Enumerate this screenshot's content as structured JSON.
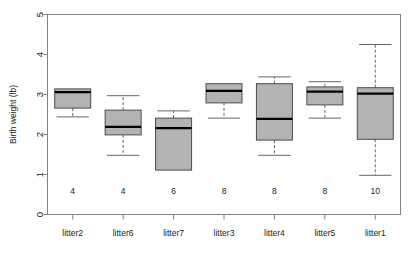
{
  "chart_data": {
    "type": "box",
    "title": "",
    "xlabel": "",
    "ylabel": "Birth weight (lb)",
    "ylim": [
      0,
      5
    ],
    "yticks": [
      0,
      1,
      2,
      3,
      4,
      5
    ],
    "ytick_labels": [
      "0",
      "1",
      "2",
      "3",
      "4",
      "5"
    ],
    "grid": false,
    "legend": "none",
    "categories": [
      "litter2",
      "litter6",
      "litter7",
      "litter3",
      "litter4",
      "litter5",
      "litter1"
    ],
    "group_counts": [
      4,
      4,
      6,
      8,
      8,
      8,
      10
    ],
    "count_label_y": 0.6,
    "box_fill": "#b3b3b3",
    "box_stroke": "#4d4d4d",
    "median_color": "#000000",
    "whisker_color": "#666666",
    "frame_color": "#808080",
    "boxes": [
      {
        "category": "litter2",
        "n": 4,
        "q1": 2.66,
        "median": 3.06,
        "q3": 3.14,
        "whisker_low": 2.44,
        "whisker_high": 3.14
      },
      {
        "category": "litter6",
        "n": 4,
        "q1": 1.99,
        "median": 2.19,
        "q3": 2.61,
        "whisker_low": 1.48,
        "whisker_high": 2.97
      },
      {
        "category": "litter7",
        "n": 6,
        "q1": 1.11,
        "median": 2.16,
        "q3": 2.41,
        "whisker_low": 1.11,
        "whisker_high": 2.59
      },
      {
        "category": "litter3",
        "n": 8,
        "q1": 2.79,
        "median": 3.09,
        "q3": 3.27,
        "whisker_low": 2.41,
        "whisker_high": 3.27
      },
      {
        "category": "litter4",
        "n": 8,
        "q1": 1.86,
        "median": 2.39,
        "q3": 3.27,
        "whisker_low": 1.48,
        "whisker_high": 3.44
      },
      {
        "category": "litter5",
        "n": 8,
        "q1": 2.74,
        "median": 3.07,
        "q3": 3.19,
        "whisker_low": 2.41,
        "whisker_high": 3.32
      },
      {
        "category": "litter1",
        "n": 10,
        "q1": 1.88,
        "median": 3.02,
        "q3": 3.17,
        "whisker_low": 0.98,
        "whisker_high": 4.25
      }
    ]
  }
}
